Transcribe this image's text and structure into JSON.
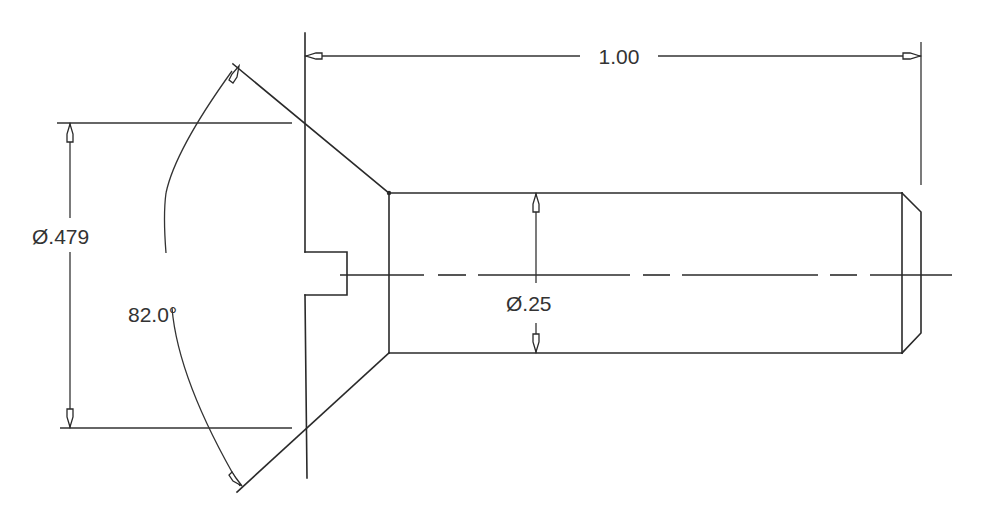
{
  "drawing": {
    "subject": "Flat head slotted screw",
    "dimensions": {
      "length": {
        "label": "1.00"
      },
      "head_diameter": {
        "label": "Ø.479",
        "symbol": "Ø",
        "value": ".479"
      },
      "shank_diameter": {
        "label": "Ø.25",
        "symbol": "Ø",
        "value": ".25"
      },
      "head_angle": {
        "label": "82.0°",
        "value": "82.0",
        "unit": "°"
      }
    },
    "colors": {
      "line": "#2a2a2a",
      "text": "#333333",
      "background": "#ffffff"
    }
  }
}
